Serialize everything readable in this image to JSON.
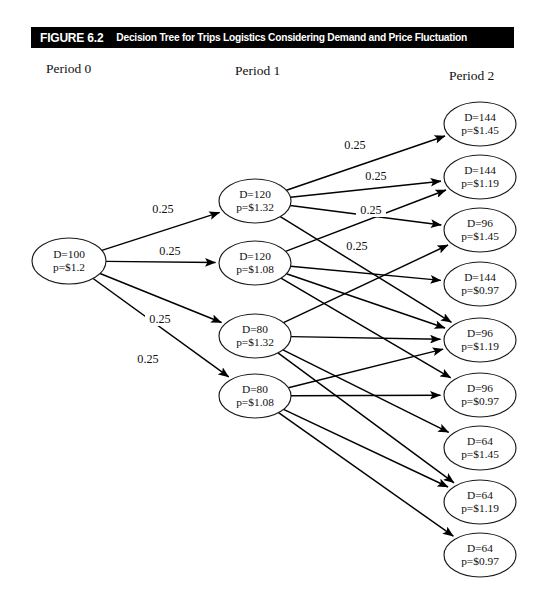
{
  "figure": {
    "number_label": "FIGURE 6.2",
    "caption": "Decision Tree for Trips Logistics Considering Demand and Price Fluctuation"
  },
  "columns": [
    {
      "label": "Period 0"
    },
    {
      "label": "Period 1"
    },
    {
      "label": "Period 2"
    }
  ],
  "nodes": {
    "period0": [
      {
        "id": "p0n0",
        "demand": "D=100",
        "price": "p=$1.2",
        "cx": 69,
        "cy": 261,
        "rx": 37,
        "ry": 23
      }
    ],
    "period1": [
      {
        "id": "p1n0",
        "demand": "D=120",
        "price": "p=$1.32",
        "cx": 255,
        "cy": 201,
        "rx": 36,
        "ry": 22
      },
      {
        "id": "p1n1",
        "demand": "D=120",
        "price": "p=$1.08",
        "cx": 255,
        "cy": 263,
        "rx": 36,
        "ry": 22
      },
      {
        "id": "p1n2",
        "demand": "D=80",
        "price": "p=$1.32",
        "cx": 255,
        "cy": 336,
        "rx": 36,
        "ry": 22
      },
      {
        "id": "p1n3",
        "demand": "D=80",
        "price": "p=$1.08",
        "cx": 255,
        "cy": 396,
        "rx": 36,
        "ry": 22
      }
    ],
    "period2": [
      {
        "id": "p2n0",
        "demand": "D=144",
        "price": "p=$1.45",
        "cx": 480,
        "cy": 124,
        "rx": 36,
        "ry": 22
      },
      {
        "id": "p2n1",
        "demand": "D=144",
        "price": "p=$1.19",
        "cx": 480,
        "cy": 177,
        "rx": 36,
        "ry": 22
      },
      {
        "id": "p2n2",
        "demand": "D=96",
        "price": "p=$1.45",
        "cx": 480,
        "cy": 230,
        "rx": 36,
        "ry": 22
      },
      {
        "id": "p2n3",
        "demand": "D=144",
        "price": "p=$0.97",
        "cx": 480,
        "cy": 284,
        "rx": 36,
        "ry": 22
      },
      {
        "id": "p2n4",
        "demand": "D=96",
        "price": "p=$1.19",
        "cx": 480,
        "cy": 340,
        "rx": 36,
        "ry": 22
      },
      {
        "id": "p2n5",
        "demand": "D=96",
        "price": "p=$0.97",
        "cx": 480,
        "cy": 395,
        "rx": 36,
        "ry": 22
      },
      {
        "id": "p2n6",
        "demand": "D=64",
        "price": "p=$1.45",
        "cx": 480,
        "cy": 448,
        "rx": 36,
        "ry": 22
      },
      {
        "id": "p2n7",
        "demand": "D=64",
        "price": "p=$1.19",
        "cx": 480,
        "cy": 502,
        "rx": 36,
        "ry": 22
      },
      {
        "id": "p2n8",
        "demand": "D=64",
        "price": "p=$0.97",
        "cx": 480,
        "cy": 555,
        "rx": 36,
        "ry": 22
      }
    ]
  },
  "edges": {
    "stage0": [
      {
        "from": "p0n0",
        "to": "p1n0",
        "probability": "0.25",
        "lx": 163,
        "ly": 213
      },
      {
        "from": "p0n0",
        "to": "p1n1",
        "probability": "0.25",
        "lx": 170,
        "ly": 255
      },
      {
        "from": "p0n0",
        "to": "p1n2",
        "probability": "0.25",
        "lx": 160,
        "ly": 323
      },
      {
        "from": "p0n0",
        "to": "p1n3",
        "probability": "0.25",
        "lx": 148,
        "ly": 363
      }
    ],
    "stage1": [
      {
        "from": "p1n0",
        "to": "p2n0",
        "probability": "0.25",
        "lx": 355,
        "ly": 149
      },
      {
        "from": "p1n0",
        "to": "p2n1",
        "probability": "0.25",
        "lx": 376,
        "ly": 180
      },
      {
        "from": "p1n0",
        "to": "p2n2",
        "probability": "0.25",
        "lx": 371,
        "ly": 214
      },
      {
        "from": "p1n0",
        "to": "p2n4",
        "probability": "0.25",
        "lx": 357,
        "ly": 250
      },
      {
        "from": "p1n1",
        "to": "p2n1",
        "probability": "",
        "lx": 0,
        "ly": 0
      },
      {
        "from": "p1n1",
        "to": "p2n3",
        "probability": "",
        "lx": 0,
        "ly": 0
      },
      {
        "from": "p1n1",
        "to": "p2n4",
        "probability": "",
        "lx": 0,
        "ly": 0
      },
      {
        "from": "p1n1",
        "to": "p2n5",
        "probability": "",
        "lx": 0,
        "ly": 0
      },
      {
        "from": "p1n2",
        "to": "p2n2",
        "probability": "",
        "lx": 0,
        "ly": 0
      },
      {
        "from": "p1n2",
        "to": "p2n4",
        "probability": "",
        "lx": 0,
        "ly": 0
      },
      {
        "from": "p1n2",
        "to": "p2n6",
        "probability": "",
        "lx": 0,
        "ly": 0
      },
      {
        "from": "p1n2",
        "to": "p2n7",
        "probability": "",
        "lx": 0,
        "ly": 0
      },
      {
        "from": "p1n3",
        "to": "p2n4",
        "probability": "",
        "lx": 0,
        "ly": 0
      },
      {
        "from": "p1n3",
        "to": "p2n5",
        "probability": "",
        "lx": 0,
        "ly": 0
      },
      {
        "from": "p1n3",
        "to": "p2n7",
        "probability": "",
        "lx": 0,
        "ly": 0
      },
      {
        "from": "p1n3",
        "to": "p2n8",
        "probability": "",
        "lx": 0,
        "ly": 0
      }
    ]
  },
  "style": {
    "title_bar_color": "#000000",
    "title_text_color": "#ffffff",
    "node_stroke_color": "#1a1a1a",
    "node_fill_color": "#ffffff",
    "edge_color": "#000000",
    "page_background": "#ffffff"
  }
}
